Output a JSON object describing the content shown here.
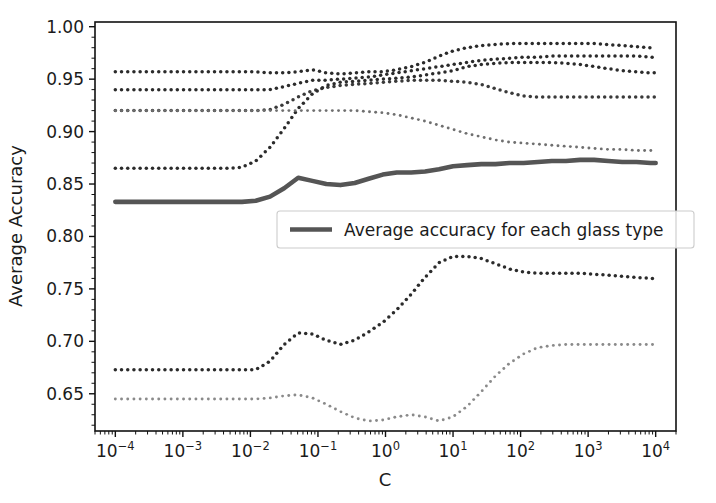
{
  "figure": {
    "width": 716,
    "height": 503,
    "background": "#ffffff"
  },
  "axes": {
    "xlabel": "C",
    "ylabel": "Average Accuracy",
    "x_tick_labels": [
      "10-4",
      "10-3",
      "10-2",
      "10-1",
      "10 0",
      "10 1",
      "10 2",
      "10 3",
      "10 4"
    ],
    "x_tick_bases": [
      "10",
      "10",
      "10",
      "10",
      "10",
      "10",
      "10",
      "10",
      "10"
    ],
    "x_tick_exponents": [
      "−4",
      "−3",
      "−2",
      "−1",
      "0",
      "1",
      "2",
      "3",
      "4"
    ],
    "y_tick_labels": [
      "1.00",
      "0.95",
      "0.90",
      "0.85",
      "0.80",
      "0.75",
      "0.70",
      "0.65"
    ],
    "y_tick_values": [
      1.0,
      0.95,
      0.9,
      0.85,
      0.8,
      0.75,
      0.7,
      0.65
    ],
    "xscale": "log",
    "xlim": [
      5e-05,
      20000
    ],
    "ylim": [
      0.6145,
      1.0045
    ],
    "grid": false,
    "tick_color": "#111111",
    "spine_color": "#111111"
  },
  "legend": {
    "label": "Average accuracy for each glass type",
    "position": "center",
    "swatch_color": "#555555"
  },
  "chart_data": {
    "type": "line",
    "title": "",
    "xlabel": "C",
    "ylabel": "Average Accuracy",
    "xscale": "log",
    "xlim": [
      5e-05,
      20000
    ],
    "ylim": [
      0.6145,
      1.0045
    ],
    "grid": false,
    "legend_position": "center",
    "x": [
      0.0001,
      0.00016,
      0.00026,
      0.00042,
      0.00068,
      0.0011,
      0.0018,
      0.0029,
      0.0046,
      0.0075,
      0.012,
      0.0195,
      0.0316,
      0.051,
      0.0825,
      0.133,
      0.215,
      0.35,
      0.562,
      0.91,
      1.47,
      2.4,
      3.85,
      6.2,
      10.0,
      16.2,
      26.2,
      42.5,
      68.5,
      111.0,
      180.0,
      290.0,
      470.0,
      760.0,
      1230.0,
      1990.0,
      3200.0,
      5200.0,
      8400.0,
      10000.0
    ],
    "series": [
      {
        "name": "glass type 1",
        "style": "dotted",
        "color": "#2b2b2b",
        "values": [
          0.957,
          0.957,
          0.957,
          0.957,
          0.957,
          0.957,
          0.957,
          0.957,
          0.957,
          0.957,
          0.957,
          0.956,
          0.956,
          0.957,
          0.959,
          0.956,
          0.955,
          0.956,
          0.957,
          0.957,
          0.959,
          0.962,
          0.966,
          0.972,
          0.977,
          0.98,
          0.982,
          0.983,
          0.984,
          0.984,
          0.984,
          0.984,
          0.984,
          0.984,
          0.984,
          0.983,
          0.982,
          0.981,
          0.98,
          0.98
        ]
      },
      {
        "name": "glass type 2",
        "style": "dotted",
        "color": "#2b2b2b",
        "values": [
          0.94,
          0.94,
          0.94,
          0.94,
          0.94,
          0.94,
          0.94,
          0.94,
          0.94,
          0.94,
          0.94,
          0.94,
          0.943,
          0.946,
          0.949,
          0.949,
          0.95,
          0.951,
          0.952,
          0.954,
          0.956,
          0.958,
          0.96,
          0.962,
          0.964,
          0.966,
          0.968,
          0.969,
          0.97,
          0.971,
          0.971,
          0.972,
          0.972,
          0.972,
          0.972,
          0.972,
          0.972,
          0.972,
          0.971,
          0.971
        ]
      },
      {
        "name": "glass type 3",
        "style": "dotted",
        "color": "#3a3a3a",
        "values": [
          0.92,
          0.92,
          0.92,
          0.92,
          0.92,
          0.92,
          0.92,
          0.92,
          0.92,
          0.92,
          0.92,
          0.921,
          0.926,
          0.933,
          0.939,
          0.942,
          0.944,
          0.945,
          0.946,
          0.947,
          0.948,
          0.949,
          0.949,
          0.949,
          0.948,
          0.947,
          0.945,
          0.941,
          0.937,
          0.934,
          0.933,
          0.933,
          0.933,
          0.933,
          0.933,
          0.933,
          0.933,
          0.933,
          0.933,
          0.933
        ]
      },
      {
        "name": "glass type 4",
        "style": "dotted",
        "color": "#2b2b2b",
        "values": [
          0.865,
          0.865,
          0.865,
          0.865,
          0.865,
          0.865,
          0.865,
          0.865,
          0.865,
          0.866,
          0.872,
          0.885,
          0.903,
          0.922,
          0.936,
          0.944,
          0.947,
          0.948,
          0.949,
          0.95,
          0.951,
          0.952,
          0.954,
          0.956,
          0.958,
          0.962,
          0.964,
          0.965,
          0.966,
          0.966,
          0.966,
          0.966,
          0.965,
          0.964,
          0.962,
          0.96,
          0.958,
          0.957,
          0.956,
          0.956
        ]
      },
      {
        "name": "glass type 5",
        "style": "dotted",
        "color": "#6f6f6f",
        "values": [
          0.92,
          0.92,
          0.92,
          0.92,
          0.92,
          0.92,
          0.92,
          0.92,
          0.92,
          0.92,
          0.92,
          0.92,
          0.92,
          0.92,
          0.92,
          0.92,
          0.92,
          0.92,
          0.919,
          0.918,
          0.916,
          0.913,
          0.91,
          0.906,
          0.902,
          0.898,
          0.895,
          0.892,
          0.89,
          0.889,
          0.888,
          0.887,
          0.886,
          0.885,
          0.884,
          0.883,
          0.883,
          0.882,
          0.882,
          0.882
        ]
      },
      {
        "name": "glass type 6",
        "style": "dotted",
        "color": "#2b2b2b",
        "values": [
          0.673,
          0.673,
          0.673,
          0.673,
          0.673,
          0.673,
          0.673,
          0.673,
          0.673,
          0.673,
          0.673,
          0.681,
          0.697,
          0.708,
          0.707,
          0.701,
          0.697,
          0.701,
          0.709,
          0.718,
          0.73,
          0.745,
          0.761,
          0.775,
          0.781,
          0.781,
          0.779,
          0.774,
          0.769,
          0.766,
          0.765,
          0.765,
          0.765,
          0.765,
          0.764,
          0.763,
          0.762,
          0.761,
          0.76,
          0.76
        ]
      },
      {
        "name": "glass type 7",
        "style": "dotted",
        "color": "#8a8a8a",
        "values": [
          0.645,
          0.645,
          0.645,
          0.645,
          0.645,
          0.645,
          0.645,
          0.645,
          0.645,
          0.645,
          0.645,
          0.646,
          0.648,
          0.649,
          0.646,
          0.64,
          0.633,
          0.627,
          0.624,
          0.625,
          0.628,
          0.63,
          0.628,
          0.624,
          0.628,
          0.638,
          0.652,
          0.667,
          0.679,
          0.688,
          0.694,
          0.696,
          0.697,
          0.697,
          0.697,
          0.697,
          0.697,
          0.697,
          0.697,
          0.697
        ]
      }
    ],
    "average_series": {
      "name": "Average accuracy for each glass type",
      "style": "solid",
      "color": "#555555",
      "values": [
        0.833,
        0.833,
        0.833,
        0.833,
        0.833,
        0.833,
        0.833,
        0.833,
        0.833,
        0.833,
        0.834,
        0.838,
        0.846,
        0.856,
        0.853,
        0.85,
        0.849,
        0.851,
        0.855,
        0.859,
        0.861,
        0.861,
        0.862,
        0.864,
        0.867,
        0.868,
        0.869,
        0.869,
        0.87,
        0.87,
        0.871,
        0.872,
        0.872,
        0.873,
        0.873,
        0.872,
        0.871,
        0.871,
        0.87,
        0.87
      ]
    }
  }
}
